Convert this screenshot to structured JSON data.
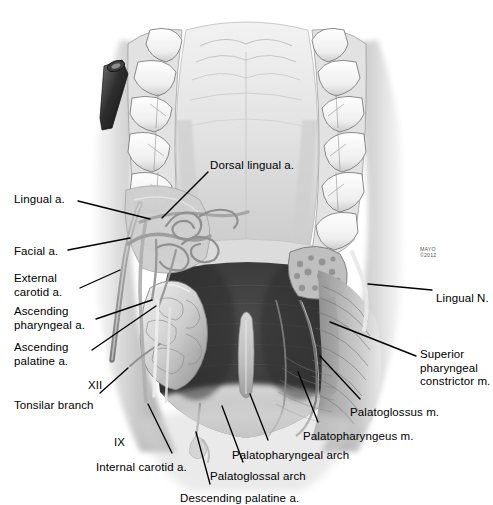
{
  "figure": {
    "modality": "medical-illustration",
    "palette": {
      "background": "#ffffff",
      "ink": "#000000",
      "tissue_light": "#e9e9e9",
      "tissue_mid": "#a8a8a8",
      "tissue_dark": "#4a4a4a",
      "cavity": "#3b3b3b",
      "cavity_deep": "#2a2a2a"
    }
  },
  "credit": {
    "line1": "MAYO",
    "line2": "©2012"
  },
  "labels": [
    {
      "id": "dorsal-lingual-a",
      "text": "Dorsal lingual a.",
      "x": 210,
      "y": 159,
      "align": "left",
      "leader": [
        [
          208,
          172
        ],
        [
          162,
          218
        ]
      ]
    },
    {
      "id": "lingual-a",
      "text": "Lingual a.",
      "x": 14,
      "y": 193,
      "align": "left",
      "leader": [
        [
          78,
          201
        ],
        [
          150,
          219
        ]
      ]
    },
    {
      "id": "facial-a",
      "text": "Facial a.",
      "x": 14,
      "y": 245,
      "align": "left",
      "leader": [
        [
          68,
          250
        ],
        [
          130,
          238
        ]
      ]
    },
    {
      "id": "external-carotid-a",
      "text": "External\ncarotid a.",
      "x": 14,
      "y": 272,
      "align": "left",
      "leader": [
        [
          80,
          288
        ],
        [
          120,
          270
        ]
      ]
    },
    {
      "id": "ascending-pharyngeal-a",
      "text": "Ascending\npharyngeal a.",
      "x": 14,
      "y": 305,
      "align": "left",
      "leader": [
        [
          96,
          319
        ],
        [
          152,
          300
        ]
      ]
    },
    {
      "id": "ascending-palatine-a",
      "text": "Ascending\npalatine a.",
      "x": 14,
      "y": 341,
      "align": "left",
      "leader": [
        [
          92,
          350
        ],
        [
          156,
          306
        ]
      ]
    },
    {
      "id": "cn-xii",
      "text": "XII",
      "x": 88,
      "y": 379,
      "align": "left",
      "leader": null
    },
    {
      "id": "tonsilar-branch",
      "text": "Tonsilar branch",
      "x": 14,
      "y": 399,
      "align": "left",
      "leader": [
        [
          100,
          393
        ],
        [
          128,
          368
        ]
      ]
    },
    {
      "id": "cn-ix",
      "text": "IX",
      "x": 114,
      "y": 436,
      "align": "left",
      "leader": null
    },
    {
      "id": "internal-carotid-a",
      "text": "Internal carotid a.",
      "x": 96,
      "y": 461,
      "align": "left",
      "leader": [
        [
          172,
          453
        ],
        [
          148,
          404
        ]
      ]
    },
    {
      "id": "descending-palatine-a",
      "text": "Descending palatine a.",
      "x": 180,
      "y": 492,
      "align": "left",
      "leader": [
        [
          210,
          484
        ],
        [
          196,
          432
        ]
      ]
    },
    {
      "id": "palatoglossal-arch",
      "text": "Palatoglossal arch",
      "x": 210,
      "y": 470,
      "align": "left",
      "leader": [
        [
          243,
          462
        ],
        [
          222,
          406
        ]
      ]
    },
    {
      "id": "palatopharyngeal-arch",
      "text": "Palatopharyngeal arch",
      "x": 232,
      "y": 449,
      "align": "left",
      "leader": [
        [
          268,
          440
        ],
        [
          250,
          394
        ]
      ]
    },
    {
      "id": "palatopharyngeus-m",
      "text": "Palatopharyngeus m.",
      "x": 303,
      "y": 430,
      "align": "left",
      "leader": [
        [
          318,
          422
        ],
        [
          298,
          372
        ]
      ]
    },
    {
      "id": "palatoglossus-m",
      "text": "Palatoglossus m.",
      "x": 350,
      "y": 406,
      "align": "left",
      "leader": [
        [
          360,
          399
        ],
        [
          320,
          356
        ]
      ]
    },
    {
      "id": "superior-pharyngeal-constrictor-m",
      "text": "Superior\npharyngeal\nconstrictor m.",
      "x": 420,
      "y": 348,
      "align": "left",
      "leader": [
        [
          416,
          356
        ],
        [
          330,
          322
        ]
      ]
    },
    {
      "id": "lingual-n",
      "text": "Lingual N.",
      "x": 436,
      "y": 292,
      "align": "left",
      "leader": [
        [
          432,
          290
        ],
        [
          368,
          284
        ]
      ]
    }
  ]
}
